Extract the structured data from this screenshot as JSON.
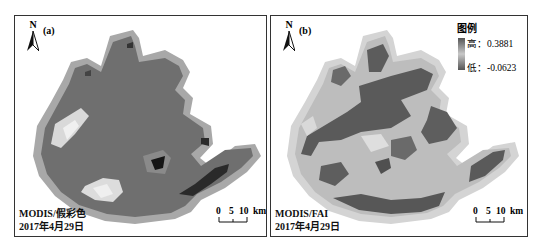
{
  "figure": {
    "panels": [
      {
        "id": "a",
        "label": "(a)",
        "north_label": "N",
        "caption_line1": "MODIS/假彩色",
        "caption_line2": "2017年4月29日",
        "scale": {
          "ticks": [
            "0",
            "5",
            "10"
          ],
          "unit": "km",
          "label": "0  5 10 km"
        }
      },
      {
        "id": "b",
        "label": "(b)",
        "north_label": "N",
        "caption_line1": "MODIS/FAI",
        "caption_line2": "2017年4月29日",
        "scale": {
          "ticks": [
            "0",
            "5",
            "10"
          ],
          "unit": "km",
          "label": "0  5 10 km"
        },
        "legend": {
          "title": "图例",
          "high_label": "高：0.3881",
          "low_label": "低：-0.0623",
          "high_value": 0.3881,
          "low_value": -0.0623
        }
      }
    ],
    "colors": {
      "frame": "#333333",
      "lake_dark": "#5a5a5a",
      "lake_mid": "#7a7a7a",
      "lake_light": "#c9c9c9",
      "shore": "#a8a8a8",
      "bloom_bright": "#e6e6e6",
      "deep_dark": "#151515"
    }
  }
}
